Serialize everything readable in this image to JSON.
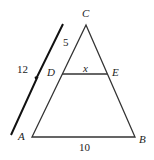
{
  "diagram": {
    "vertices": {
      "C": "C",
      "D": "D",
      "E": "E",
      "A": "A",
      "B": "B"
    },
    "measures": {
      "CD": "5",
      "CA": "12",
      "DE": "x",
      "AB": "10"
    },
    "colors": {
      "stroke": "#333333"
    }
  }
}
